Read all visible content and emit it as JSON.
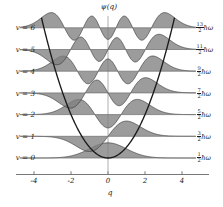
{
  "figure": {
    "title_axis_top": "ψ(q)",
    "xaxis_title": "q",
    "background": "#ffffff",
    "fill_color": "#808080",
    "line_color": "#333333",
    "parabola_color": "#1a1a1a"
  },
  "axis": {
    "xticks": [
      "-4",
      "-2",
      "0",
      "2",
      "4"
    ],
    "xtick_values": [
      -4,
      -2,
      0,
      2,
      4
    ],
    "xlim": [
      -4.8,
      4.8
    ],
    "ylim": [
      -0.6,
      7.4
    ]
  },
  "levels": [
    {
      "v_label": "v = 0",
      "v": 0,
      "energy_num": "1",
      "energy_den": "2",
      "energy_unit": "ħω"
    },
    {
      "v_label": "v = 1",
      "v": 1,
      "energy_num": "3",
      "energy_den": "2",
      "energy_unit": "ħω"
    },
    {
      "v_label": "v = 2",
      "v": 2,
      "energy_num": "5",
      "energy_den": "2",
      "energy_unit": "ħω"
    },
    {
      "v_label": "v = 3",
      "v": 3,
      "energy_num": "7",
      "energy_den": "2",
      "energy_unit": "ħω"
    },
    {
      "v_label": "v = 4",
      "v": 4,
      "energy_num": "9",
      "energy_den": "2",
      "energy_unit": "ħω"
    },
    {
      "v_label": "v = 5",
      "v": 5,
      "energy_num": "11",
      "energy_den": "2",
      "energy_unit": "ħω"
    },
    {
      "v_label": "v = 6",
      "v": 6,
      "energy_num": "13",
      "energy_den": "2",
      "energy_unit": "ħω"
    }
  ],
  "chart_data": {
    "type": "line",
    "title": "",
    "xlabel": "q",
    "ylabel": "ψ(q)",
    "xlim": [
      -4.8,
      4.8
    ],
    "ylim": [
      -0.6,
      7.4
    ],
    "grid": false,
    "legend": "none",
    "xticks": [
      -4,
      -2,
      0,
      2,
      4
    ],
    "annotations_left": [
      "v = 0",
      "v = 1",
      "v = 2",
      "v = 3",
      "v = 4",
      "v = 5",
      "v = 6"
    ],
    "annotations_right": [
      "1/2 ħω",
      "3/2 ħω",
      "5/2 ħω",
      "7/2 ħω",
      "9/2 ħω",
      "11/2 ħω",
      "13/2 ħω"
    ],
    "series": [
      {
        "name": "potential V(q) = q^2/2 parabola",
        "kind": "curve",
        "coefficient": 0.5
      },
      {
        "name": "psi_0",
        "kind": "wavefunction",
        "quantum_number": 0,
        "baseline": 0,
        "nodes": 0,
        "lobes": 1
      },
      {
        "name": "psi_1",
        "kind": "wavefunction",
        "quantum_number": 1,
        "baseline": 1,
        "nodes": 1,
        "lobes": 2
      },
      {
        "name": "psi_2",
        "kind": "wavefunction",
        "quantum_number": 2,
        "baseline": 2,
        "nodes": 2,
        "lobes": 3
      },
      {
        "name": "psi_3",
        "kind": "wavefunction",
        "quantum_number": 3,
        "baseline": 3,
        "nodes": 3,
        "lobes": 4
      },
      {
        "name": "psi_4",
        "kind": "wavefunction",
        "quantum_number": 4,
        "baseline": 4,
        "nodes": 4,
        "lobes": 5
      },
      {
        "name": "psi_5",
        "kind": "wavefunction",
        "quantum_number": 5,
        "baseline": 5,
        "nodes": 5,
        "lobes": 6
      },
      {
        "name": "psi_6",
        "kind": "wavefunction",
        "quantum_number": 6,
        "baseline": 6,
        "nodes": 6,
        "lobes": 7
      }
    ],
    "turning_points": [
      {
        "v": 0,
        "q": [
          -1.0,
          1.0
        ]
      },
      {
        "v": 1,
        "q": [
          -1.73,
          1.73
        ]
      },
      {
        "v": 2,
        "q": [
          -2.24,
          2.24
        ]
      },
      {
        "v": 3,
        "q": [
          -2.65,
          2.65
        ]
      },
      {
        "v": 4,
        "q": [
          -3.0,
          3.0
        ]
      },
      {
        "v": 5,
        "q": [
          -3.32,
          3.32
        ]
      },
      {
        "v": 6,
        "q": [
          -3.61,
          3.61
        ]
      }
    ]
  }
}
